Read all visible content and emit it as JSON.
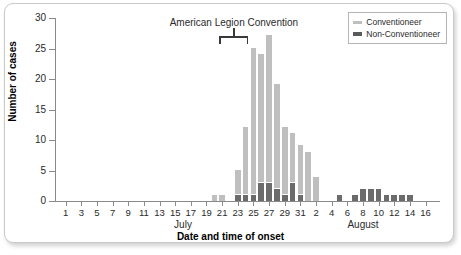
{
  "chart_data": {
    "type": "bar",
    "title": "",
    "xlabel": "Date and time of onset",
    "ylabel": "Number of cases",
    "ylim": [
      0,
      30
    ],
    "ytick_values": [
      0,
      5,
      10,
      15,
      20,
      25,
      30
    ],
    "grid": false,
    "stacked": true,
    "legend_position": "top-right",
    "annotations": [
      {
        "text": "American Legion Convention",
        "bracket_start": "July 21",
        "bracket_end": "July 24"
      }
    ],
    "month_labels": [
      "July",
      "August"
    ],
    "xtick_labels": [
      "1",
      "3",
      "5",
      "7",
      "9",
      "11",
      "13",
      "15",
      "17",
      "19",
      "21",
      "23",
      "25",
      "27",
      "29",
      "31",
      "2",
      "4",
      "6",
      "8",
      "10",
      "12",
      "14",
      "16"
    ],
    "categories": [
      "Jul 1",
      "Jul 2",
      "Jul 3",
      "Jul 4",
      "Jul 5",
      "Jul 6",
      "Jul 7",
      "Jul 8",
      "Jul 9",
      "Jul 10",
      "Jul 11",
      "Jul 12",
      "Jul 13",
      "Jul 14",
      "Jul 15",
      "Jul 16",
      "Jul 17",
      "Jul 18",
      "Jul 19",
      "Jul 20",
      "Jul 21",
      "Jul 22",
      "Jul 23",
      "Jul 24",
      "Jul 25",
      "Jul 26",
      "Jul 27",
      "Jul 28",
      "Jul 29",
      "Jul 30",
      "Jul 31",
      "Aug 1",
      "Aug 2",
      "Aug 3",
      "Aug 4",
      "Aug 5",
      "Aug 6",
      "Aug 7",
      "Aug 8",
      "Aug 9",
      "Aug 10",
      "Aug 11",
      "Aug 12",
      "Aug 13",
      "Aug 14",
      "Aug 15",
      "Aug 16"
    ],
    "series": [
      {
        "name": "Conventioneer",
        "color": "#bfbfbf",
        "values": [
          0,
          0,
          0,
          0,
          0,
          0,
          0,
          0,
          0,
          0,
          0,
          0,
          0,
          0,
          0,
          0,
          0,
          0,
          0,
          1,
          1,
          0,
          4,
          11,
          24,
          21,
          24,
          17,
          11,
          8,
          8,
          8,
          4,
          0,
          0,
          0,
          0,
          0,
          0,
          0,
          0,
          0,
          0,
          0,
          0,
          0,
          0
        ]
      },
      {
        "name": "Non-Conventioneer",
        "color": "#6b6b6b",
        "values": [
          0,
          0,
          0,
          0,
          0,
          0,
          0,
          0,
          0,
          0,
          0,
          0,
          0,
          0,
          0,
          0,
          0,
          0,
          0,
          0,
          0,
          0,
          1,
          1,
          1,
          3,
          3,
          2,
          1,
          3,
          1,
          0,
          0,
          0,
          0,
          1,
          0,
          1,
          2,
          2,
          2,
          1,
          1,
          1,
          1,
          0,
          0
        ]
      }
    ],
    "totals": [
      0,
      0,
      0,
      0,
      0,
      0,
      0,
      0,
      0,
      0,
      0,
      0,
      0,
      0,
      0,
      0,
      0,
      0,
      0,
      1,
      1,
      0,
      5,
      12,
      25,
      24,
      27,
      19,
      12,
      11,
      9,
      8,
      4,
      0,
      0,
      1,
      0,
      1,
      2,
      2,
      2,
      1,
      1,
      1,
      1,
      0,
      0
    ]
  },
  "legend": {
    "items": [
      {
        "label": "Conventioneer"
      },
      {
        "label": "Non-Conventioneer"
      }
    ]
  }
}
